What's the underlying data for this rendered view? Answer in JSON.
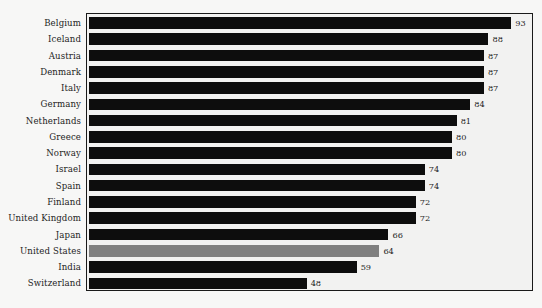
{
  "chart_data": {
    "type": "bar",
    "orientation": "horizontal",
    "title": "",
    "subtitle": "",
    "xlabel": "",
    "ylabel": "",
    "xlim": [
      0,
      98
    ],
    "grid": false,
    "legend": null,
    "value_labels_shown": true,
    "highlight_category": "United States",
    "colors": {
      "bar": "#0d0d0d",
      "highlight_bar": "#808080",
      "plot_background": "#f2f2f1",
      "page_background": "#f7f7f6",
      "frame": "#1a1a1a",
      "text": "#1d1d1d"
    },
    "categories": [
      "Belgium",
      "Iceland",
      "Austria",
      "Denmark",
      "Italy",
      "Germany",
      "Netherlands",
      "Greece",
      "Norway",
      "Israel",
      "Spain",
      "Finland",
      "United Kingdom",
      "Japan",
      "United States",
      "India",
      "Switzerland"
    ],
    "values": [
      93,
      88,
      87,
      87,
      87,
      84,
      81,
      80,
      80,
      74,
      74,
      72,
      72,
      66,
      64,
      59,
      48
    ]
  }
}
